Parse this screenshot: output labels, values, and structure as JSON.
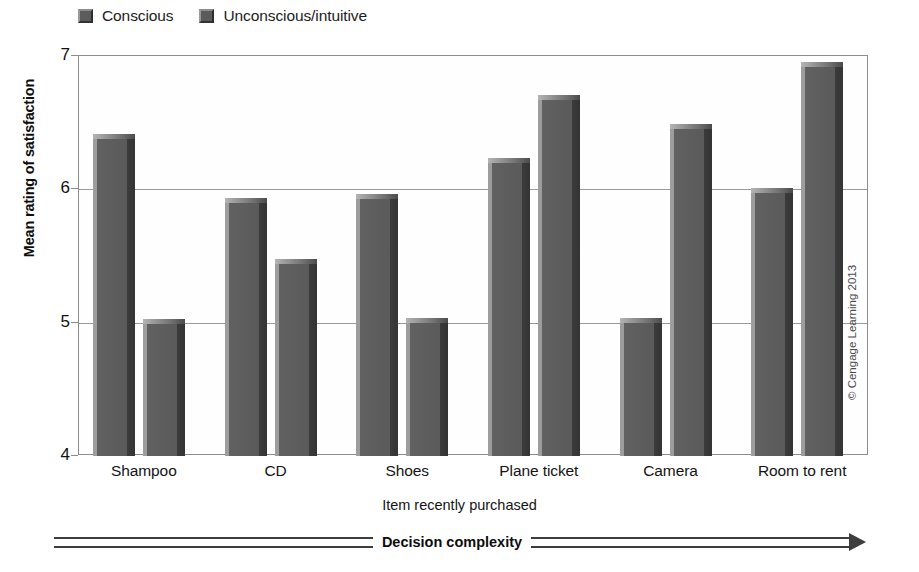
{
  "chart_data": {
    "type": "bar",
    "title": "",
    "xlabel": "Item recently purchased",
    "ylabel": "Mean rating of satisfaction",
    "categories": [
      "Shampoo",
      "CD",
      "Shoes",
      "Plane ticket",
      "Camera",
      "Room to rent"
    ],
    "series": [
      {
        "name": "Conscious",
        "values": [
          6.38,
          5.9,
          5.93,
          6.2,
          5.0,
          5.97
        ],
        "color": "#5d5d5d"
      },
      {
        "name": "Unconscious/intuitive",
        "values": [
          4.99,
          5.44,
          5.0,
          6.67,
          6.45,
          6.92
        ],
        "color": "#5d5d5d"
      }
    ],
    "ylim": [
      4,
      7
    ],
    "yticks": [
      4,
      5,
      6,
      7
    ],
    "ytick_labels": [
      "4",
      "5",
      "6",
      "7"
    ],
    "grid": true,
    "legend_position": "top-left",
    "annotation": "Decision complexity",
    "credit": "© Cengage Learning 2013"
  },
  "legend": {
    "items": [
      {
        "label": "Conscious"
      },
      {
        "label": "Unconscious/intuitive"
      }
    ]
  },
  "axes": {
    "y_title": "Mean rating of satisfaction",
    "x_title": "Item recently purchased",
    "y_ticks": [
      "7",
      "6",
      "5",
      "4"
    ],
    "x_ticks": [
      "Shampoo",
      "CD",
      "Shoes",
      "Plane ticket",
      "Camera",
      "Room to rent"
    ]
  },
  "footer": {
    "complexity_label": "Decision complexity",
    "credit": "© Cengage Learning 2013"
  }
}
